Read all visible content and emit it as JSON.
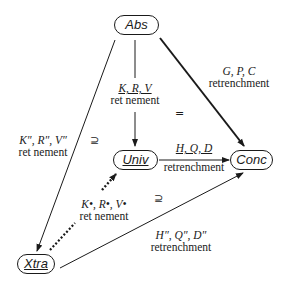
{
  "nodes": {
    "abs": {
      "label": "Abs",
      "underlined": false
    },
    "univ": {
      "label": "Univ",
      "underlined": true
    },
    "conc": {
      "label": "Conc",
      "underlined": false
    },
    "xtra": {
      "label": "Xtra",
      "underlined": true
    }
  },
  "edges": {
    "abs_univ": {
      "relation": "K, R, V",
      "kind": "ret nement",
      "underlined": true
    },
    "abs_conc": {
      "relation": "G, P, C",
      "kind": "retrenchment"
    },
    "abs_xtra": {
      "relation": "K″, R″, V″",
      "kind": "ret nement"
    },
    "univ_conc": {
      "relation": "H, Q, D",
      "kind": "retrenchment",
      "underlined": true
    },
    "xtra_univ": {
      "relation": "K•, R•, V•",
      "kind": "ret nement",
      "style": "dotted"
    },
    "xtra_conc": {
      "relation": "H″, Q″, D″",
      "kind": "retrenchment"
    }
  },
  "symbols": {
    "equals": "=",
    "supseteq_left": "⊇",
    "supseteq_right": "⊇"
  }
}
